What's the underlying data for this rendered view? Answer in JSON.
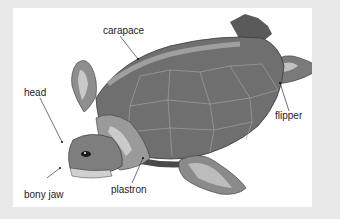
{
  "diagram": {
    "labels": [
      {
        "id": "carapace",
        "text": "carapace"
      },
      {
        "id": "head",
        "text": "head"
      },
      {
        "id": "flipper",
        "text": "flipper"
      },
      {
        "id": "bony_jaw",
        "text": "bony jaw"
      },
      {
        "id": "plastron",
        "text": "plastron"
      }
    ]
  },
  "colors": {
    "frame": "#e9e9e9",
    "panel": "#ffffff",
    "shell_dark": "#6f6f6f",
    "shell_mid": "#8a8a8a",
    "shell_light": "#b4b4b4",
    "skin_light": "#c2c2c2",
    "outline": "#3a3a3a",
    "label_text": "#222222"
  }
}
